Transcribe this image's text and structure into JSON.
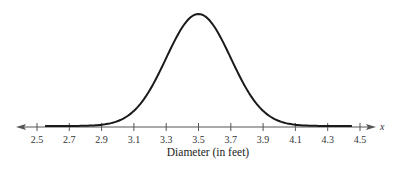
{
  "chart_data": {
    "type": "line",
    "title": "",
    "xlabel": "Diameter (in feet)",
    "ylabel": "",
    "axis_variable": "x",
    "xlim": [
      2.5,
      4.5
    ],
    "xticks": [
      2.5,
      2.7,
      2.9,
      3.1,
      3.3,
      3.5,
      3.7,
      3.9,
      4.1,
      4.3,
      4.5
    ],
    "xtick_labels": [
      "2.5",
      "2.7",
      "2.9",
      "3.1",
      "3.3",
      "3.5",
      "3.7",
      "3.9",
      "4.1",
      "4.3",
      "4.5"
    ],
    "grid": false,
    "legend": null,
    "series": [
      {
        "name": "normal curve",
        "distribution": "normal",
        "mean": 3.5,
        "std_dev": 0.2,
        "x": [
          2.5,
          2.7,
          2.9,
          3.0,
          3.1,
          3.2,
          3.3,
          3.4,
          3.5,
          3.6,
          3.7,
          3.8,
          3.9,
          4.0,
          4.1,
          4.3,
          4.5
        ],
        "values_relative": [
          0.0,
          0.0,
          0.011,
          0.044,
          0.135,
          0.325,
          0.607,
          0.882,
          1.0,
          0.882,
          0.607,
          0.325,
          0.135,
          0.044,
          0.011,
          0.0,
          0.0
        ]
      }
    ]
  },
  "colors": {
    "curve": "#1a1a1a",
    "axis": "#555555",
    "text": "#333333"
  }
}
